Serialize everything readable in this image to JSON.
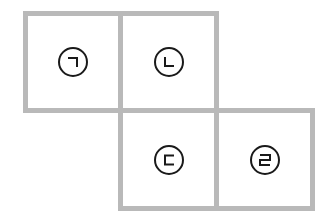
{
  "diagram": {
    "border_color": "#b9b9b9",
    "cells": [
      {
        "row": 1,
        "col": 1,
        "letter": "ㄱ",
        "label": "㉠"
      },
      {
        "row": 1,
        "col": 2,
        "letter": "ㄴ",
        "label": "㉡"
      },
      {
        "row": 2,
        "col": 2,
        "letter": "ㄷ",
        "label": "㉢"
      },
      {
        "row": 2,
        "col": 3,
        "letter": "ㄹ",
        "label": "㉣"
      }
    ]
  }
}
